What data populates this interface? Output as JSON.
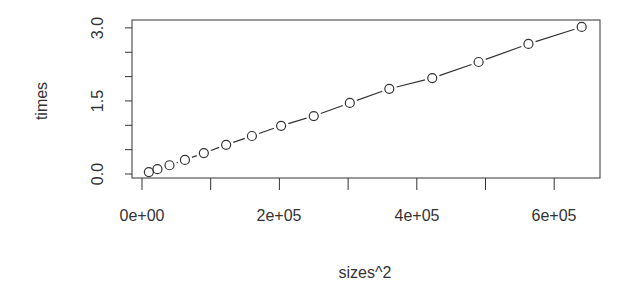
{
  "chart_data": {
    "type": "scatter",
    "title": "",
    "xlabel": "sizes^2",
    "ylabel": "times",
    "xlim": [
      -8000,
      662000
    ],
    "ylim": [
      -0.02,
      3.1
    ],
    "grid": false,
    "legend": null,
    "plot_type": "both points and line segments (R type='b')",
    "x_ticks": [
      0,
      100000,
      200000,
      300000,
      400000,
      500000,
      600000
    ],
    "x_tick_labels": [
      "0e+00",
      "",
      "2e+05",
      "",
      "4e+05",
      "",
      "6e+05"
    ],
    "y_ticks": [
      0.0,
      0.5,
      1.0,
      1.5,
      2.0,
      2.5,
      3.0
    ],
    "y_tick_labels": [
      "0.0",
      "",
      "",
      "1.5",
      "",
      "",
      "3.0"
    ],
    "x": [
      10000,
      22500,
      40000,
      62500,
      90000,
      122500,
      160000,
      202500,
      250000,
      302500,
      360000,
      422500,
      490000,
      562500,
      640000
    ],
    "y": [
      0.04,
      0.1,
      0.18,
      0.29,
      0.43,
      0.6,
      0.78,
      0.99,
      1.19,
      1.46,
      1.75,
      1.97,
      2.3,
      2.67,
      3.02
    ]
  },
  "labels": {
    "xlabel": "sizes^2",
    "ylabel": "times",
    "x_tick_0": "0e+00",
    "x_tick_2": "2e+05",
    "x_tick_4": "4e+05",
    "x_tick_6": "6e+05",
    "y_tick_0": "0.0",
    "y_tick_15": "1.5",
    "y_tick_3": "3.0"
  },
  "colors": {
    "stroke": "#333333",
    "background": "#ffffff"
  }
}
